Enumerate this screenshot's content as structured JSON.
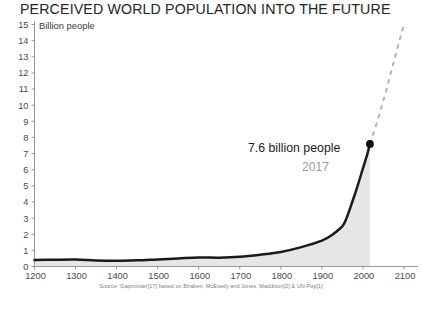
{
  "chart_data": {
    "type": "line",
    "title": "PERCEIVED WORLD POPULATION INTO THE FUTURE",
    "ylabel": "Billion people",
    "xlabel": "",
    "xlim": [
      1200,
      2100
    ],
    "ylim": [
      0,
      15
    ],
    "grid": false,
    "legend": null,
    "source": "Source: Gapminder[17] based on Biraben, McEvedy and Jones, Maddison[2] & UN-Pop[1]",
    "x_ticks": [
      1200,
      1300,
      1400,
      1500,
      1600,
      1700,
      1800,
      1900,
      2000,
      2100
    ],
    "y_ticks": [
      0,
      1,
      2,
      3,
      4,
      5,
      6,
      7,
      8,
      9,
      10,
      11,
      12,
      13,
      14,
      15
    ],
    "annotations": [
      {
        "label": "7.6 billion people",
        "sublabel": "2017",
        "x": 2017,
        "y": 7.6,
        "marker": "dot"
      }
    ],
    "series": [
      {
        "name": "Historical population",
        "style": "solid",
        "color": "#1a1a1a",
        "fill": true,
        "fill_color": "#e6e6e6",
        "x": [
          1200,
          1250,
          1300,
          1350,
          1400,
          1450,
          1500,
          1550,
          1600,
          1650,
          1700,
          1750,
          1800,
          1850,
          1900,
          1927,
          1950,
          1960,
          1974,
          1987,
          1999,
          2011,
          2017
        ],
        "y": [
          0.4,
          0.42,
          0.43,
          0.37,
          0.35,
          0.38,
          0.44,
          0.5,
          0.56,
          0.55,
          0.6,
          0.73,
          0.9,
          1.2,
          1.6,
          2.0,
          2.5,
          3.0,
          4.0,
          5.0,
          6.0,
          7.0,
          7.6
        ]
      },
      {
        "name": "Projected population",
        "style": "dashed",
        "color": "#b0b0b0",
        "fill": false,
        "x": [
          2017,
          2030,
          2050,
          2070,
          2090,
          2100
        ],
        "y": [
          7.6,
          8.6,
          10.3,
          12.2,
          14.1,
          15.0
        ]
      }
    ]
  },
  "chart": {
    "title": "PERCEIVED WORLD POPULATION INTO THE FUTURE",
    "y_axis_label": "Billion people",
    "annotation_value": "7.6 billion people",
    "annotation_year": "2017",
    "source": "Source: Gapminder[17] based on Biraben, McEvedy and Jones, Maddison[2] & UN-Pop[1]",
    "colors": {
      "line": "#1a1a1a",
      "projection": "#b0b0b0",
      "fill": "#e6e6e6",
      "axis": "#8c8c8c",
      "text": "#2b2b2b",
      "muted_text": "#9a9a9a"
    }
  }
}
